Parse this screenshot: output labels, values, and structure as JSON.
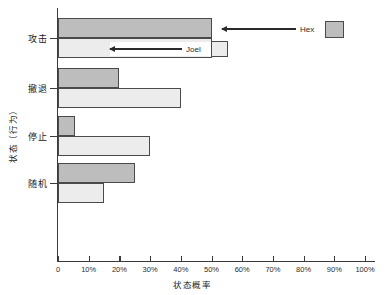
{
  "chart_data": {
    "type": "bar",
    "orientation": "horizontal",
    "title": "",
    "xlabel": "状态概率",
    "ylabel": "状态（行为）",
    "categories": [
      "攻击",
      "撤退",
      "停止",
      "随机"
    ],
    "series": [
      {
        "name": "Hex",
        "color": "#bdbdbd",
        "values": [
          50,
          20,
          5.5,
          25
        ]
      },
      {
        "name": "Joel",
        "color": "#ececec",
        "values": [
          50,
          40,
          30,
          15
        ]
      }
    ],
    "xlim": [
      0,
      100
    ],
    "xticks": [
      0,
      10,
      20,
      30,
      40,
      50,
      60,
      70,
      80,
      90,
      100
    ],
    "xticklabels": [
      "0",
      "10%",
      "20%",
      "30%",
      "40%",
      "50%",
      "60%",
      "70%",
      "80%",
      "90%",
      "100%"
    ],
    "grid": false,
    "legend_position": "inline-callouts",
    "annotations": [
      {
        "text": "Hex",
        "target_series": "Hex",
        "target_category": "攻击",
        "arrow": "left"
      },
      {
        "text": "Joel",
        "target_series": "Joel",
        "target_category": "攻击",
        "arrow": "left"
      }
    ]
  },
  "axis": {
    "x_title": "状态概率",
    "y_title": "状态（行为）"
  },
  "legend": {
    "hex_label": "Hex",
    "joel_label": "Joel"
  }
}
